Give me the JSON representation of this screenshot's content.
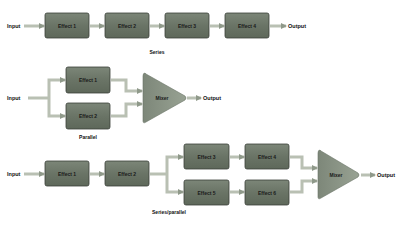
{
  "colors": {
    "box_fill": "#6f7a6b",
    "box_stroke": "#3a3f38",
    "connector": "#b9c0b3",
    "arrow_head": "#8f998a",
    "mixer_fill": "#8a9485",
    "text": "#111111"
  },
  "series": {
    "input_label": "Input",
    "output_label": "Output",
    "caption": "Series",
    "effects": [
      "Effect 1",
      "Effect 2",
      "Effect 3",
      "Effect 4"
    ]
  },
  "parallel": {
    "input_label": "Input",
    "output_label": "Output",
    "caption": "Parallel",
    "effects": [
      "Effect 1",
      "Effect 2"
    ],
    "mixer_label": "Mixer"
  },
  "series_parallel": {
    "input_label": "Input",
    "output_label": "Output",
    "caption": "Series/parallel",
    "effects": [
      "Effect 1",
      "Effect 2",
      "Effect 3",
      "Effect 4",
      "Effect 5",
      "Effect 6"
    ],
    "mixer_label": "Mixer"
  }
}
